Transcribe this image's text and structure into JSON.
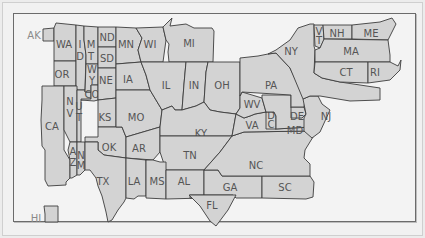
{
  "map": {
    "type": "stylized-us-state-map",
    "fill_color": "#d3d3d3",
    "border_color": "#3c3c3c",
    "label_color": "#555555",
    "outside_label_color": "#8a8a8a",
    "background_color": "#f3f3f3"
  },
  "labels": {
    "AK": "AK",
    "HI": "HI",
    "WA": "WA",
    "OR": "OR",
    "CA": "CA",
    "ID1": "I",
    "ID2": "D",
    "NV1": "N",
    "NV2": "V",
    "UT1": "U",
    "UT2": "T",
    "AZ1": "A",
    "AZ2": "Z",
    "MT1": "M",
    "MT2": "T",
    "WY1": "W",
    "WY2": "Y",
    "CO": "CO",
    "NM1": "N",
    "NM2": "M",
    "ND": "ND",
    "SD": "SD",
    "NE": "NE",
    "KS": "KS",
    "OK": "OK",
    "TX": "TX",
    "MN": "MN",
    "IA": "IA",
    "MO": "MO",
    "AR": "AR",
    "LA": "LA",
    "WI": "WI",
    "MI": "MI",
    "IL": "IL",
    "IN": "IN",
    "OH": "OH",
    "KY": "KY",
    "TN": "TN",
    "MS": "MS",
    "AL": "AL",
    "GA": "GA",
    "FL": "FL",
    "SC": "SC",
    "NC": "NC",
    "VA": "VA",
    "WV": "WV",
    "DC1": "D",
    "DC2": "C",
    "MD": "MD",
    "DE": "DE",
    "PA": "PA",
    "NJ": "NJ",
    "NY": "NY",
    "VT1": "V",
    "VT2": "T",
    "NH": "NH",
    "ME": "ME",
    "MA": "MA",
    "CT": "CT",
    "RI": "RI"
  }
}
